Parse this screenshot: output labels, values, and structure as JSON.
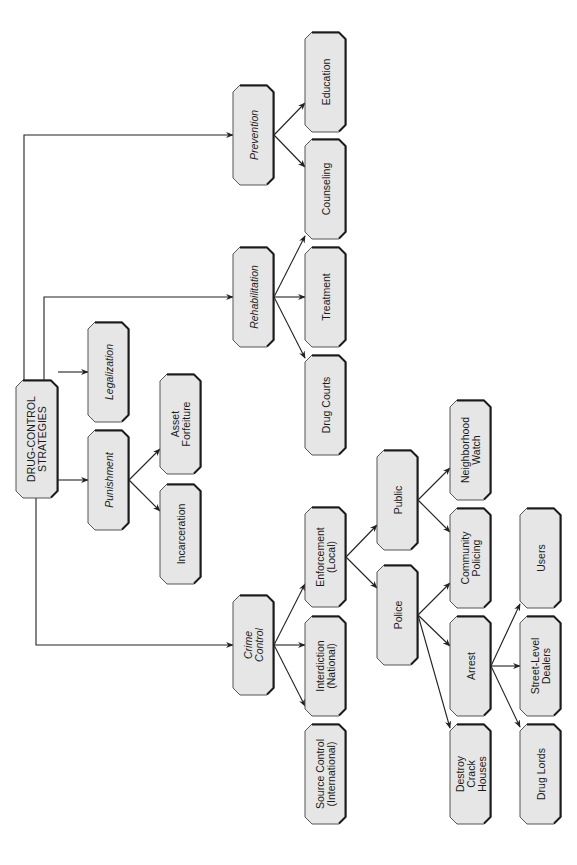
{
  "diagram": {
    "orientation": "rotated -90deg (tree grows left to right, read bottom to top)",
    "colors": {
      "box_fill": "#e6e6e6",
      "box_stroke": "#555555",
      "box_shadow": "#1a1a1a",
      "line": "#222222"
    },
    "nodes": [
      {
        "id": "root",
        "label": "DRUG-CONTROL\nSTRATEGIES",
        "italic": false,
        "x": 16,
        "y": 380,
        "w": 42,
        "h": 118
      },
      {
        "id": "prevention",
        "label": "Prevention",
        "italic": true,
        "x": 233,
        "y": 85,
        "w": 41,
        "h": 100
      },
      {
        "id": "education",
        "label": "Education",
        "italic": false,
        "x": 305,
        "y": 32,
        "w": 41,
        "h": 100
      },
      {
        "id": "counseling",
        "label": "Counseling",
        "italic": false,
        "x": 305,
        "y": 139,
        "w": 41,
        "h": 100
      },
      {
        "id": "rehabilitation",
        "label": "Rehabilitation",
        "italic": true,
        "x": 233,
        "y": 247,
        "w": 41,
        "h": 100
      },
      {
        "id": "treatment",
        "label": "Treatment",
        "italic": false,
        "x": 305,
        "y": 247,
        "w": 41,
        "h": 100
      },
      {
        "id": "drug-courts",
        "label": "Drug Courts",
        "italic": false,
        "x": 305,
        "y": 355,
        "w": 41,
        "h": 100
      },
      {
        "id": "legalization",
        "label": "Legalization",
        "italic": true,
        "x": 88,
        "y": 322,
        "w": 41,
        "h": 100
      },
      {
        "id": "punishment",
        "label": "Punishment",
        "italic": true,
        "x": 88,
        "y": 430,
        "w": 41,
        "h": 100
      },
      {
        "id": "asset-forfeiture",
        "label": "Asset\nForfeiture",
        "italic": false,
        "x": 160,
        "y": 374,
        "w": 41,
        "h": 100
      },
      {
        "id": "incarceration",
        "label": "Incarceration",
        "italic": false,
        "x": 160,
        "y": 484,
        "w": 41,
        "h": 100
      },
      {
        "id": "crime-control",
        "label": "Crime\nControl",
        "italic": true,
        "x": 233,
        "y": 595,
        "w": 41,
        "h": 100
      },
      {
        "id": "enforcement",
        "label": "Enforcement\n(Local)",
        "italic": false,
        "x": 305,
        "y": 507,
        "w": 41,
        "h": 100
      },
      {
        "id": "interdiction",
        "label": "Interdiction\n(National)",
        "italic": false,
        "x": 305,
        "y": 616,
        "w": 41,
        "h": 100
      },
      {
        "id": "source-control",
        "label": "Source Control\n(International)",
        "italic": false,
        "x": 305,
        "y": 724,
        "w": 41,
        "h": 100
      },
      {
        "id": "public",
        "label": "Public",
        "italic": false,
        "x": 377,
        "y": 450,
        "w": 41,
        "h": 100
      },
      {
        "id": "police",
        "label": "Police",
        "italic": false,
        "x": 377,
        "y": 565,
        "w": 41,
        "h": 100
      },
      {
        "id": "neighborhood-watch",
        "label": "Neighborhood\nWatch",
        "italic": false,
        "x": 450,
        "y": 400,
        "w": 41,
        "h": 100
      },
      {
        "id": "community-policing",
        "label": "Community\nPolicing",
        "italic": false,
        "x": 450,
        "y": 508,
        "w": 41,
        "h": 100
      },
      {
        "id": "arrest",
        "label": "Arrest",
        "italic": false,
        "x": 450,
        "y": 616,
        "w": 41,
        "h": 100
      },
      {
        "id": "destroy-crack-houses",
        "label": "Destroy\nCrack\nHouses",
        "italic": false,
        "x": 450,
        "y": 724,
        "w": 41,
        "h": 100
      },
      {
        "id": "users",
        "label": "Users",
        "italic": false,
        "x": 520,
        "y": 508,
        "w": 41,
        "h": 100
      },
      {
        "id": "street-level-dealers",
        "label": "Street-Level\nDealers",
        "italic": false,
        "x": 520,
        "y": 616,
        "w": 41,
        "h": 100
      },
      {
        "id": "drug-lords",
        "label": "Drug Lords",
        "italic": false,
        "x": 520,
        "y": 724,
        "w": 41,
        "h": 100
      }
    ],
    "edges": [
      {
        "from": "root",
        "to": "prevention",
        "path": [
          [
            24,
            380
          ],
          [
            24,
            135
          ],
          [
            233,
            135
          ]
        ]
      },
      {
        "from": "root",
        "to": "rehabilitation",
        "path": [
          [
            44,
            380
          ],
          [
            44,
            297
          ],
          [
            233,
            297
          ]
        ]
      },
      {
        "from": "root",
        "to": "legalization",
        "path": [
          [
            58,
            372
          ],
          [
            88,
            372
          ]
        ]
      },
      {
        "from": "root",
        "to": "punishment",
        "path": [
          [
            58,
            480
          ],
          [
            88,
            480
          ]
        ]
      },
      {
        "from": "root",
        "to": "crime-control",
        "path": [
          [
            36,
            498
          ],
          [
            36,
            645
          ],
          [
            233,
            645
          ]
        ]
      },
      {
        "from": "prevention",
        "to": "education",
        "path": [
          [
            274,
            135
          ],
          [
            305,
            103
          ]
        ]
      },
      {
        "from": "prevention",
        "to": "counseling",
        "path": [
          [
            274,
            135
          ],
          [
            305,
            167
          ]
        ]
      },
      {
        "from": "rehabilitation",
        "to": "counseling",
        "path": [
          [
            274,
            297
          ],
          [
            305,
            236
          ]
        ]
      },
      {
        "from": "rehabilitation",
        "to": "treatment",
        "path": [
          [
            274,
            297
          ],
          [
            305,
            297
          ]
        ]
      },
      {
        "from": "rehabilitation",
        "to": "drug-courts",
        "path": [
          [
            274,
            297
          ],
          [
            305,
            358
          ]
        ]
      },
      {
        "from": "punishment",
        "to": "asset-forfeiture",
        "path": [
          [
            129,
            480
          ],
          [
            160,
            449
          ]
        ]
      },
      {
        "from": "punishment",
        "to": "incarceration",
        "path": [
          [
            129,
            480
          ],
          [
            160,
            511
          ]
        ]
      },
      {
        "from": "crime-control",
        "to": "enforcement",
        "path": [
          [
            274,
            645
          ],
          [
            305,
            584
          ]
        ]
      },
      {
        "from": "crime-control",
        "to": "interdiction",
        "path": [
          [
            274,
            645
          ],
          [
            305,
            645
          ]
        ]
      },
      {
        "from": "crime-control",
        "to": "source-control",
        "path": [
          [
            274,
            645
          ],
          [
            305,
            706
          ]
        ]
      },
      {
        "from": "enforcement",
        "to": "public",
        "path": [
          [
            346,
            557
          ],
          [
            377,
            525
          ]
        ]
      },
      {
        "from": "enforcement",
        "to": "police",
        "path": [
          [
            346,
            557
          ],
          [
            377,
            588
          ]
        ]
      },
      {
        "from": "public",
        "to": "neighborhood-watch",
        "path": [
          [
            418,
            500
          ],
          [
            450,
            468
          ]
        ]
      },
      {
        "from": "public",
        "to": "community-policing",
        "path": [
          [
            418,
            500
          ],
          [
            450,
            532
          ]
        ]
      },
      {
        "from": "police",
        "to": "community-policing",
        "path": [
          [
            418,
            615
          ],
          [
            450,
            583
          ]
        ]
      },
      {
        "from": "police",
        "to": "arrest",
        "path": [
          [
            418,
            615
          ],
          [
            450,
            646
          ]
        ]
      },
      {
        "from": "police",
        "to": "destroy-crack-houses",
        "path": [
          [
            418,
            615
          ],
          [
            450,
            728
          ]
        ]
      },
      {
        "from": "arrest",
        "to": "users",
        "path": [
          [
            491,
            666
          ],
          [
            520,
            604
          ]
        ]
      },
      {
        "from": "arrest",
        "to": "street-level-dealers",
        "path": [
          [
            491,
            666
          ],
          [
            520,
            666
          ]
        ]
      },
      {
        "from": "arrest",
        "to": "drug-lords",
        "path": [
          [
            491,
            666
          ],
          [
            520,
            727
          ]
        ]
      }
    ]
  }
}
